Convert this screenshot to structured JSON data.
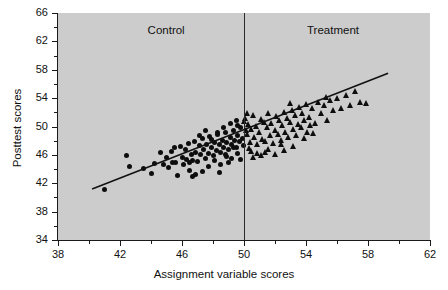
{
  "figure": {
    "background_color": "#ffffff",
    "plot_background_color": "#cccccc",
    "axis_color": "#1a1a1a",
    "marker_color": "#0d0d0d",
    "caption_partial": ""
  },
  "chart_data": {
    "type": "scatter",
    "title": "",
    "xlabel": "Assignment variable scores",
    "ylabel": "Posttest scores",
    "xlim": [
      38,
      62
    ],
    "ylim": [
      34,
      66
    ],
    "xticks": [
      38,
      42,
      46,
      50,
      54,
      58,
      62
    ],
    "yticks": [
      34,
      38,
      42,
      46,
      50,
      54,
      58,
      62,
      66
    ],
    "xtick_labels": [
      "38",
      "42",
      "46",
      "50",
      "54",
      "58",
      "62"
    ],
    "ytick_labels": [
      "34",
      "38",
      "42",
      "46",
      "50",
      "54",
      "58",
      "62",
      "66"
    ],
    "grid": false,
    "legend": "none",
    "annotations": [
      {
        "text": "Control",
        "x": 45.2,
        "y": 63.4
      },
      {
        "text": "Treatment",
        "x": 56.0,
        "y": 63.4
      }
    ],
    "cutoff": {
      "type": "vline",
      "x": 50,
      "label": "cutoff"
    },
    "regression_line": {
      "x_start": 40.2,
      "y_start": 41.2,
      "x_end": 59.3,
      "y_end": 57.5,
      "slope": 0.853,
      "intercept": 6.91
    },
    "series": [
      {
        "name": "Control",
        "marker": "circle",
        "points": [
          [
            41.0,
            41.1
          ],
          [
            42.4,
            45.9
          ],
          [
            42.6,
            44.3
          ],
          [
            43.5,
            44.1
          ],
          [
            44.2,
            44.8
          ],
          [
            44.6,
            46.3
          ],
          [
            44.8,
            44.6
          ],
          [
            45.0,
            45.6
          ],
          [
            45.1,
            44.2
          ],
          [
            45.3,
            46.5
          ],
          [
            45.4,
            45.0
          ],
          [
            45.6,
            44.9
          ],
          [
            45.7,
            43.1
          ],
          [
            45.9,
            47.2
          ],
          [
            46.0,
            45.6
          ],
          [
            46.1,
            44.7
          ],
          [
            46.2,
            46.8
          ],
          [
            46.3,
            45.3
          ],
          [
            46.4,
            47.6
          ],
          [
            46.5,
            44.9
          ],
          [
            46.6,
            46.1
          ],
          [
            46.7,
            45.2
          ],
          [
            46.8,
            47.9
          ],
          [
            46.9,
            46.4
          ],
          [
            47.0,
            45.1
          ],
          [
            47.1,
            47.3
          ],
          [
            47.2,
            46.0
          ],
          [
            47.3,
            48.3
          ],
          [
            47.4,
            46.7
          ],
          [
            47.5,
            45.5
          ],
          [
            47.6,
            47.5
          ],
          [
            47.7,
            46.2
          ],
          [
            47.8,
            48.6
          ],
          [
            47.9,
            47.0
          ],
          [
            48.0,
            45.9
          ],
          [
            48.1,
            47.8
          ],
          [
            48.2,
            46.6
          ],
          [
            48.3,
            48.9
          ],
          [
            48.4,
            47.4
          ],
          [
            48.5,
            46.3
          ],
          [
            48.6,
            48.1
          ],
          [
            48.7,
            47.1
          ],
          [
            48.8,
            49.2
          ],
          [
            48.9,
            47.7
          ],
          [
            49.0,
            46.7
          ],
          [
            49.1,
            48.4
          ],
          [
            49.2,
            47.5
          ],
          [
            49.3,
            49.5
          ],
          [
            49.4,
            48.0
          ],
          [
            49.5,
            47.0
          ],
          [
            49.6,
            48.8
          ],
          [
            49.7,
            47.9
          ],
          [
            49.8,
            49.8
          ],
          [
            49.9,
            48.3
          ],
          [
            49.95,
            47.3
          ],
          [
            49.6,
            50.1
          ],
          [
            49.3,
            47.1
          ],
          [
            48.9,
            45.8
          ],
          [
            48.5,
            44.6
          ],
          [
            48.1,
            45.2
          ],
          [
            47.7,
            44.4
          ],
          [
            47.3,
            43.7
          ],
          [
            46.9,
            43.3
          ],
          [
            46.5,
            43.8
          ],
          [
            49.1,
            50.4
          ],
          [
            49.5,
            50.8
          ],
          [
            48.7,
            49.9
          ],
          [
            48.3,
            49.1
          ],
          [
            47.9,
            48.2
          ],
          [
            47.5,
            49.4
          ],
          [
            47.1,
            48.8
          ],
          [
            46.7,
            42.9
          ],
          [
            48.4,
            43.5
          ],
          [
            49.0,
            44.9
          ],
          [
            49.6,
            46.2
          ],
          [
            49.8,
            45.4
          ],
          [
            49.2,
            45.5
          ],
          [
            48.8,
            46.0
          ],
          [
            45.5,
            47.0
          ],
          [
            44.0,
            43.4
          ]
        ]
      },
      {
        "name": "Treatment",
        "marker": "triangle",
        "points": [
          [
            50.1,
            51.2
          ],
          [
            50.2,
            48.9
          ],
          [
            50.3,
            50.3
          ],
          [
            50.4,
            47.8
          ],
          [
            50.5,
            49.6
          ],
          [
            50.6,
            51.6
          ],
          [
            50.7,
            48.5
          ],
          [
            50.8,
            50.0
          ],
          [
            50.9,
            47.4
          ],
          [
            51.0,
            49.2
          ],
          [
            51.1,
            51.0
          ],
          [
            51.2,
            48.2
          ],
          [
            51.3,
            50.6
          ],
          [
            51.4,
            47.9
          ],
          [
            51.5,
            49.9
          ],
          [
            51.6,
            51.8
          ],
          [
            51.7,
            48.7
          ],
          [
            51.8,
            50.4
          ],
          [
            51.9,
            47.6
          ],
          [
            52.0,
            49.4
          ],
          [
            52.1,
            51.4
          ],
          [
            52.2,
            48.9
          ],
          [
            52.3,
            50.9
          ],
          [
            52.4,
            48.1
          ],
          [
            52.5,
            50.1
          ],
          [
            52.6,
            52.0
          ],
          [
            52.7,
            49.1
          ],
          [
            52.8,
            51.1
          ],
          [
            52.9,
            48.4
          ],
          [
            53.0,
            50.6
          ],
          [
            53.1,
            52.3
          ],
          [
            53.2,
            49.6
          ],
          [
            53.3,
            51.5
          ],
          [
            53.4,
            48.8
          ],
          [
            53.5,
            50.3
          ],
          [
            53.6,
            52.7
          ],
          [
            53.7,
            49.9
          ],
          [
            53.8,
            51.9
          ],
          [
            53.9,
            50.8
          ],
          [
            54.0,
            53.1
          ],
          [
            54.2,
            51.3
          ],
          [
            54.4,
            52.5
          ],
          [
            54.6,
            50.5
          ],
          [
            54.8,
            53.4
          ],
          [
            55.0,
            51.8
          ],
          [
            55.2,
            52.9
          ],
          [
            55.4,
            50.9
          ],
          [
            55.6,
            53.7
          ],
          [
            55.8,
            52.2
          ],
          [
            56.0,
            54.0
          ],
          [
            56.3,
            52.6
          ],
          [
            56.6,
            54.4
          ],
          [
            56.9,
            53.0
          ],
          [
            57.2,
            55.0
          ],
          [
            57.5,
            53.4
          ],
          [
            57.9,
            53.2
          ],
          [
            50.05,
            50.7
          ],
          [
            50.15,
            49.4
          ],
          [
            50.25,
            51.9
          ],
          [
            50.35,
            46.9
          ],
          [
            50.5,
            46.5
          ],
          [
            50.9,
            46.2
          ],
          [
            51.4,
            46.4
          ],
          [
            52.0,
            46.0
          ],
          [
            52.6,
            46.6
          ],
          [
            53.2,
            47.2
          ],
          [
            51.1,
            45.9
          ],
          [
            50.6,
            45.6
          ],
          [
            54.1,
            49.2
          ],
          [
            54.5,
            49.0
          ],
          [
            53.9,
            48.3
          ],
          [
            52.4,
            47.4
          ],
          [
            51.6,
            46.8
          ],
          [
            55.3,
            54.1
          ],
          [
            54.3,
            50.1
          ],
          [
            53.0,
            53.2
          ]
        ]
      }
    ]
  }
}
